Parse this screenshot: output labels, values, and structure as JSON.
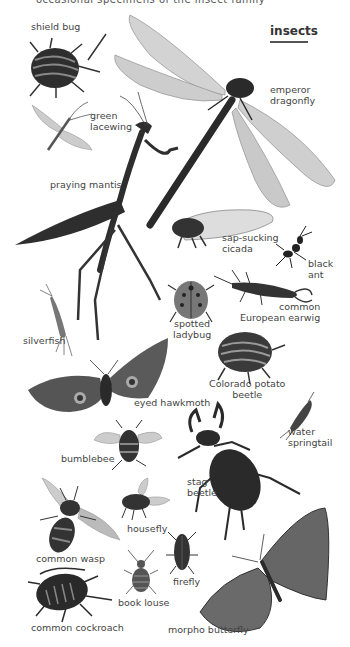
{
  "header": {
    "cut_text": "occasional specimens of the insect family",
    "title": "insects"
  },
  "insects": [
    {
      "id": "shield-bug",
      "label": "shield bug"
    },
    {
      "id": "emperor-dragonfly",
      "label_line1": "emperor",
      "label_line2": "dragonfly"
    },
    {
      "id": "green-lacewing",
      "label_line1": "green",
      "label_line2": "lacewing"
    },
    {
      "id": "praying-mantis",
      "label": "praying mantis"
    },
    {
      "id": "sap-sucking-cicada",
      "label_line1": "sap-sucking",
      "label_line2": "cicada"
    },
    {
      "id": "black-ant",
      "label_line1": "black",
      "label_line2": "ant"
    },
    {
      "id": "spotted-ladybug",
      "label_line1": "spotted",
      "label_line2": "ladybug"
    },
    {
      "id": "common-european-earwig",
      "label_line1": "common",
      "label_line2": "European earwig"
    },
    {
      "id": "silverfish",
      "label": "silverfish"
    },
    {
      "id": "colorado-potato-beetle",
      "label_line1": "Colorado potato",
      "label_line2": "beetle"
    },
    {
      "id": "eyed-hawkmoth",
      "label": "eyed hawkmoth"
    },
    {
      "id": "water-springtail",
      "label_line1": "water",
      "label_line2": "springtail"
    },
    {
      "id": "bumblebee",
      "label": "bumblebee"
    },
    {
      "id": "stag-beetle",
      "label_line1": "stag",
      "label_line2": "beetle"
    },
    {
      "id": "common-wasp",
      "label": "common wasp"
    },
    {
      "id": "housefly",
      "label": "housefly"
    },
    {
      "id": "firefly",
      "label": "firefly"
    },
    {
      "id": "book-louse",
      "label": "book louse"
    },
    {
      "id": "common-cockroach",
      "label": "common cockroach"
    },
    {
      "id": "morpho-butterfly",
      "label": "morpho butterfly"
    }
  ],
  "colors": {
    "background": "#ffffff",
    "label_text": "#444444",
    "insect_dark": "#2a2a2a",
    "insect_mid": "#666666",
    "wing_light": "#cfcfcf"
  }
}
